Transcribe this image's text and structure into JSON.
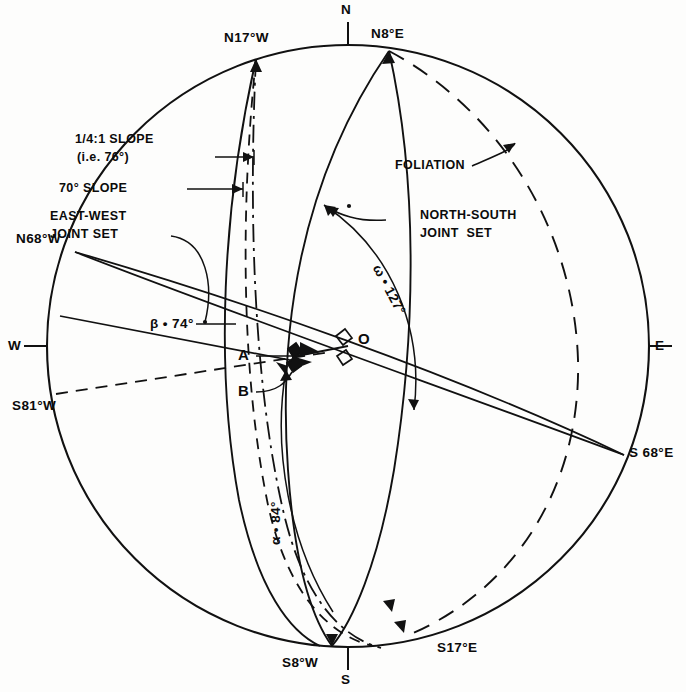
{
  "figure": {
    "type": "stereographic-projection-diagram",
    "background_color": "#fdfdfc",
    "line_color": "#111111",
    "center_label": "O",
    "radius_px": 301,
    "center_px": [
      348,
      346
    ]
  },
  "compass_labels": {
    "north": "N",
    "south": "S",
    "east": "E",
    "west": "W"
  },
  "bearing_labels": [
    {
      "id": "n17w",
      "text": "N17°W"
    },
    {
      "id": "n8e",
      "text": "N8°E"
    },
    {
      "id": "n68w",
      "text": "N68°W"
    },
    {
      "id": "s81w",
      "text": "S81°W"
    },
    {
      "id": "s68e",
      "text": "S 68°E"
    },
    {
      "id": "s8w",
      "text": "S8°W"
    },
    {
      "id": "s17e",
      "text": "S17°E"
    }
  ],
  "annotations": {
    "slope_quarter": {
      "line1": "1/4:1 SLOPE",
      "line2": "(i.e. 76°)"
    },
    "slope_seventy": "70° SLOPE",
    "east_west_joint_set": {
      "line1": "EAST-WEST",
      "line2": "JOINT SET"
    },
    "north_south_joint_set": {
      "line1": "NORTH-SOUTH",
      "line2": "JOINT  SET"
    },
    "foliation": "FOLIATION"
  },
  "angles": {
    "beta": "β • 74°",
    "omega": "ω • 127°",
    "alpha": "α • 84°"
  },
  "points": {
    "a": "A",
    "b": "B",
    "o": "O"
  }
}
